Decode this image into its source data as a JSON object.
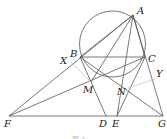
{
  "figure": {
    "caption": "图 1",
    "colors": {
      "line": "#555555",
      "aux_line": "#c8c8c8",
      "label": "#222222"
    },
    "circle": {
      "name": "circumcircle",
      "through": [
        "A",
        "B",
        "C"
      ]
    },
    "points": {
      "A": {
        "label": "A"
      },
      "B": {
        "label": "B"
      },
      "C": {
        "label": "C"
      },
      "D": {
        "label": "D"
      },
      "E": {
        "label": "E"
      },
      "F": {
        "label": "F"
      },
      "G": {
        "label": "G"
      },
      "M": {
        "label": "M"
      },
      "N": {
        "label": "N"
      },
      "X": {
        "label": "X"
      },
      "Y": {
        "label": "Y"
      }
    },
    "segments": [
      [
        "A",
        "B"
      ],
      [
        "A",
        "C"
      ],
      [
        "B",
        "C"
      ],
      [
        "A",
        "F"
      ],
      [
        "A",
        "M"
      ],
      [
        "A",
        "E"
      ],
      [
        "A",
        "G"
      ],
      [
        "B",
        "D"
      ],
      [
        "B",
        "G"
      ],
      [
        "C",
        "F"
      ],
      [
        "C",
        "E"
      ],
      [
        "F",
        "G"
      ]
    ],
    "aux_segments": [
      [
        "X",
        "M"
      ],
      [
        "N",
        "Y"
      ]
    ]
  }
}
